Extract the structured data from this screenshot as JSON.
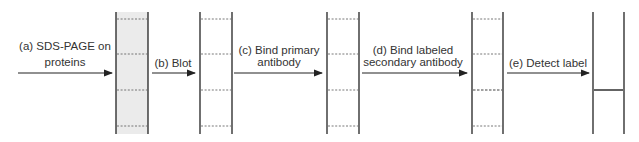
{
  "steps": [
    {
      "id": "a",
      "label_lines": [
        "(a) SDS-PAGE on",
        "proteins"
      ]
    },
    {
      "id": "b",
      "label_lines": [
        "(b) Blot"
      ]
    },
    {
      "id": "c",
      "label_lines": [
        "(c) Bind primary",
        "antibody"
      ]
    },
    {
      "id": "d",
      "label_lines": [
        "(d) Bind labeled",
        "secondary antibody"
      ]
    },
    {
      "id": "e",
      "label_lines": [
        "(e) Detect label"
      ]
    }
  ],
  "lanes": [
    {
      "name": "gel",
      "shaded": true,
      "bands": [
        "dashed",
        "dashed",
        "dashed",
        "dashed"
      ]
    },
    {
      "name": "blot",
      "shaded": false,
      "bands": [
        "dotted",
        "dotted",
        "dotted",
        "dotted"
      ]
    },
    {
      "name": "primary-antibody",
      "shaded": false,
      "bands": [
        "dotted",
        "dotted",
        "dotted",
        "dotted"
      ]
    },
    {
      "name": "secondary-antibody",
      "shaded": false,
      "bands": [
        "dotted",
        "dotted",
        "bold-dashed",
        "dotted"
      ]
    },
    {
      "name": "detected",
      "shaded": false,
      "bands": [
        "none",
        "none",
        "solid",
        "none"
      ]
    }
  ],
  "colors": {
    "line": "#222222",
    "gel_fill": "#ebebeb",
    "band": "#555555"
  }
}
